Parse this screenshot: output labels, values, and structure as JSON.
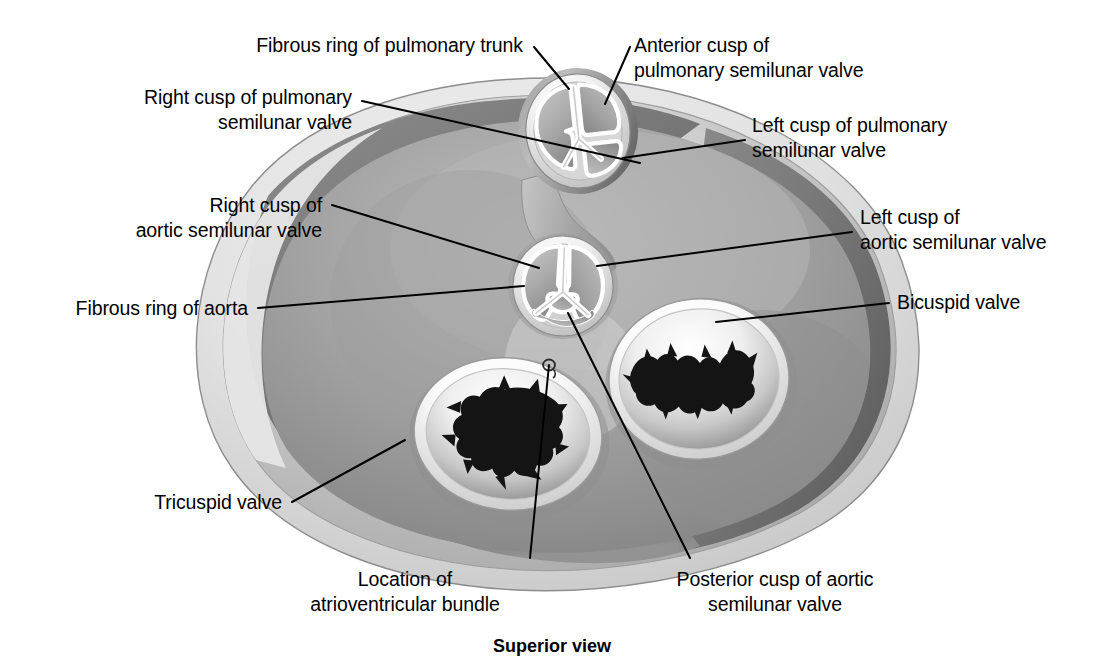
{
  "figure": {
    "caption": "Superior view"
  },
  "colors": {
    "ink": "#000000",
    "leader": "#000000",
    "background": "#ffffff",
    "epicardium_light": "#d9d9d9",
    "myocardium_mid": "#9a9a9a",
    "myocardium_dark": "#6d6d6d",
    "valve_ring_light": "#f2f2f2",
    "valve_opening_dark": "#111111"
  },
  "labels": [
    {
      "id": "fibrous-ring-of-pulmonary-trunk",
      "lines": [
        "Fibrous ring of pulmonary trunk"
      ],
      "align": "right",
      "x": 523,
      "y": 33,
      "leader": [
        [
          534,
          47
        ],
        [
          569,
          89
        ]
      ]
    },
    {
      "id": "right-cusp-of-pulmonary-semilunar-valve",
      "lines": [
        "Right cusp of pulmonary",
        "semilunar valve"
      ],
      "align": "right",
      "x": 352,
      "y": 85,
      "leader": [
        [
          362,
          101
        ],
        [
          640,
          163
        ]
      ]
    },
    {
      "id": "anterior-cusp-of-pulmonary-semilunar-valve",
      "lines": [
        "Anterior cusp of",
        "pulmonary semilunar valve"
      ],
      "align": "left",
      "x": 634,
      "y": 33,
      "leader": [
        [
          630,
          47
        ],
        [
          605,
          104
        ]
      ]
    },
    {
      "id": "left-cusp-of-pulmonary-semilunar-valve",
      "lines": [
        "Left cusp of pulmonary",
        "semilunar valve"
      ],
      "align": "left",
      "x": 752,
      "y": 113,
      "leader": [
        [
          745,
          140
        ],
        [
          623,
          158
        ]
      ]
    },
    {
      "id": "right-cusp-of-aortic-semilunar-valve",
      "lines": [
        "Right cusp of",
        "aortic semilunar valve"
      ],
      "align": "right",
      "x": 322,
      "y": 193,
      "leader": [
        [
          332,
          205
        ],
        [
          539,
          268
        ]
      ]
    },
    {
      "id": "left-cusp-of-aortic-semilunar-valve",
      "lines": [
        "Left cusp of",
        "aortic semilunar valve"
      ],
      "align": "left",
      "x": 860,
      "y": 205,
      "leader": [
        [
          852,
          232
        ],
        [
          597,
          266
        ]
      ]
    },
    {
      "id": "fibrous-ring-of-aorta",
      "lines": [
        "Fibrous ring of aorta"
      ],
      "align": "right",
      "x": 248,
      "y": 296,
      "leader": [
        [
          258,
          308
        ],
        [
          524,
          286
        ]
      ]
    },
    {
      "id": "bicuspid-valve",
      "lines": [
        "Bicuspid valve"
      ],
      "align": "left",
      "x": 897,
      "y": 290,
      "leader": [
        [
          889,
          303
        ],
        [
          716,
          322
        ]
      ]
    },
    {
      "id": "tricuspid-valve",
      "lines": [
        "Tricuspid valve"
      ],
      "align": "right",
      "x": 282,
      "y": 490,
      "leader": [
        [
          292,
          502
        ],
        [
          405,
          440
        ]
      ]
    },
    {
      "id": "location-of-atrioventricular-bundle",
      "lines": [
        "Location of",
        "atrioventricular bundle"
      ],
      "align": "center",
      "x": 385,
      "y": 567,
      "leader": [
        [
          530,
          558
        ],
        [
          549,
          365
        ]
      ]
    },
    {
      "id": "posterior-cusp-of-aortic-semilunar-valve",
      "lines": [
        "Posterior cusp of aortic",
        "semilunar valve"
      ],
      "align": "center",
      "x": 655,
      "y": 567,
      "leader": [
        [
          690,
          558
        ],
        [
          568,
          313
        ]
      ]
    }
  ],
  "structures": [
    {
      "id": "pulmonary-semilunar-valve",
      "label": "Pulmonary semilunar valve",
      "cusps": 3,
      "shape": "oval-ring",
      "cx": 578,
      "cy": 131
    },
    {
      "id": "aortic-semilunar-valve",
      "label": "Aortic semilunar valve",
      "cusps": 3,
      "shape": "circular-ring",
      "cx": 563,
      "cy": 286
    },
    {
      "id": "bicuspid-valve",
      "label": "Bicuspid valve (mitral)",
      "cusps": 2,
      "shape": "oval-ring",
      "cx": 699,
      "cy": 379
    },
    {
      "id": "tricuspid-valve",
      "label": "Tricuspid valve",
      "cusps": 3,
      "shape": "oval-ring",
      "cx": 508,
      "cy": 434
    },
    {
      "id": "atrioventricular-bundle-marker",
      "label": "Location of atrioventricular bundle",
      "shape": "small-circle",
      "cx": 549,
      "cy": 365
    }
  ]
}
